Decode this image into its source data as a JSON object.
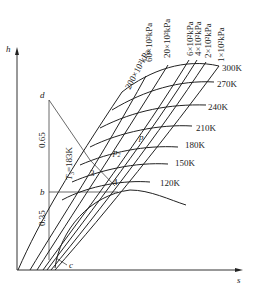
{
  "diagram": {
    "type": "h-s enthalpy-entropy diagram",
    "axes": {
      "y_label": "h",
      "x_label": "s"
    },
    "isobars": [
      {
        "label": "200×10²kPa"
      },
      {
        "label": "60×10²kPa"
      },
      {
        "label": "20×10²kPa"
      },
      {
        "label": "6×10²kPa"
      },
      {
        "label": "4×10²kPa"
      },
      {
        "label": "2×10²kPa"
      },
      {
        "label": "1×10²kPa"
      }
    ],
    "isotherms": [
      {
        "label": "300K"
      },
      {
        "label": "270K"
      },
      {
        "label": "240K"
      },
      {
        "label": "210K"
      },
      {
        "label": "180K"
      },
      {
        "label": "150K"
      },
      {
        "label": "120K"
      }
    ],
    "points": {
      "d": "d",
      "b": "b",
      "c": "c",
      "p": "p",
      "p2_base": "p",
      "p2_sub": "2",
      "pt3": "3",
      "pt4": "4"
    },
    "annotations": {
      "upper_fraction": "0.65",
      "lower_fraction": "0.35",
      "t3_label": "T",
      "t3_sub": "3",
      "t3_value": "=183K"
    }
  }
}
